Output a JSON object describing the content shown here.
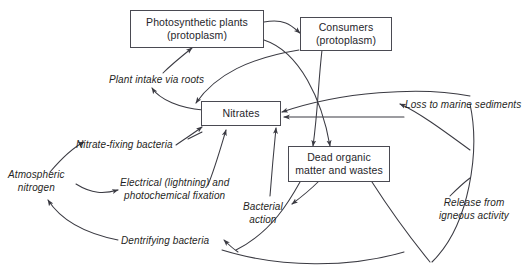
{
  "diagram": {
    "background_color": "#ffffff",
    "stroke_color": "#3a3a42",
    "box_border_color": "#4a4a52",
    "text_color": "#26262b",
    "nodes": [
      {
        "id": "photosynthetic-plants",
        "line1": "Photosynthetic plants",
        "line2": "(protoplasm)"
      },
      {
        "id": "consumers",
        "line1": "Consumers",
        "line2": "(protoplasm)"
      },
      {
        "id": "nitrates",
        "line1": "Nitrates",
        "line2": ""
      },
      {
        "id": "dead-organic-matter",
        "line1": "Dead organic",
        "line2": "matter and wastes"
      }
    ],
    "edge_labels": [
      {
        "id": "plant-intake-via-roots",
        "line1": "Plant intake via roots",
        "line2": ""
      },
      {
        "id": "loss-to-marine-sediments",
        "line1": "Loss to marine sediments",
        "line2": ""
      },
      {
        "id": "nitrate-fixing-bacteria",
        "line1": "Nitrate-fixing bacteria",
        "line2": ""
      },
      {
        "id": "atmospheric-nitrogen",
        "line1": "Atmospheric",
        "line2": "nitrogen"
      },
      {
        "id": "electrical-photochemical-fixation",
        "line1": "Electrical (lightning) and",
        "line2": "photochemical fixation"
      },
      {
        "id": "bacterial-action",
        "line1": "Bacterial",
        "line2": "action"
      },
      {
        "id": "dentrifying-bacteria",
        "line1": "Dentrifying bacteria",
        "line2": ""
      },
      {
        "id": "release-from-igneous-activity",
        "line1": "Release from",
        "line2": "igneous activity"
      }
    ]
  }
}
